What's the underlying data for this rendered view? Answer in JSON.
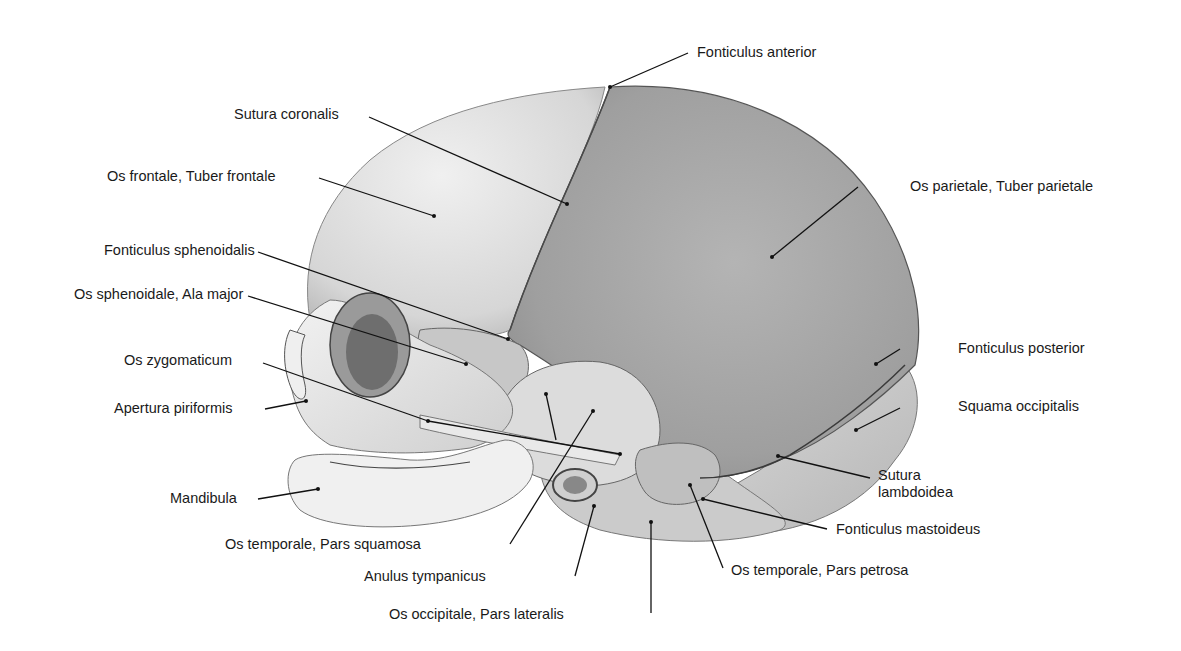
{
  "figure": {
    "colors": {
      "background": "#ffffff",
      "bone_light": "#e6e6e6",
      "bone_mid": "#cfcfcf",
      "parietal": "#a9a9a9",
      "suture_line": "#4a4a4a",
      "leader_line": "#111111",
      "label_text": "#1a1a1a"
    }
  },
  "labels": [
    {
      "id": "fonticulus-anterior",
      "text": "Fonticulus anterior",
      "x": 697,
      "y": 44,
      "anchor": "left",
      "line": [
        [
          688,
          53
        ],
        [
          610,
          87
        ]
      ]
    },
    {
      "id": "sutura-coronalis",
      "text": "Sutura coronalis",
      "x": 234,
      "y": 106,
      "anchor": "left",
      "line": [
        [
          369,
          117
        ],
        [
          567,
          204
        ]
      ]
    },
    {
      "id": "os-frontale",
      "text": "Os frontale, Tuber frontale",
      "x": 107,
      "y": 168,
      "anchor": "left",
      "line": [
        [
          319,
          178
        ],
        [
          434,
          216
        ]
      ]
    },
    {
      "id": "os-parietale",
      "text": "Os parietale, Tuber parietale",
      "x": 910,
      "y": 178,
      "anchor": "left",
      "line": [
        [
          858,
          187
        ],
        [
          772,
          257
        ]
      ]
    },
    {
      "id": "fonticulus-sphenoidalis",
      "text": "Fonticulus sphenoidalis",
      "x": 104,
      "y": 242,
      "anchor": "left",
      "line": [
        [
          258,
          252
        ],
        [
          508,
          339
        ]
      ]
    },
    {
      "id": "os-sphenoidale",
      "text": "Os sphenoidale, Ala major",
      "x": 74,
      "y": 286,
      "anchor": "left",
      "line": [
        [
          248,
          296
        ],
        [
          466,
          364
        ]
      ]
    },
    {
      "id": "fonticulus-posterior",
      "text": "Fonticulus posterior",
      "x": 958,
      "y": 340,
      "anchor": "left",
      "line": [
        [
          900,
          349
        ],
        [
          876,
          364
        ]
      ]
    },
    {
      "id": "os-zygomaticum",
      "text": "Os zygomaticum",
      "x": 124,
      "y": 352,
      "anchor": "left",
      "line": [
        [
          263,
          363
        ],
        [
          428,
          421
        ]
      ]
    },
    {
      "id": "apertura-piriformis",
      "text": "Apertura piriformis",
      "x": 114,
      "y": 400,
      "anchor": "left",
      "line": [
        [
          265,
          409
        ],
        [
          306,
          401
        ]
      ]
    },
    {
      "id": "squama-occipitalis",
      "text": "Squama occipitalis",
      "x": 958,
      "y": 398,
      "anchor": "left",
      "line": [
        [
          900,
          408
        ],
        [
          856,
          430
        ]
      ]
    },
    {
      "id": "sutura-lambdoidea",
      "text": "Sutura\nlambdoidea",
      "x": 878,
      "y": 467,
      "anchor": "left",
      "multiline": true,
      "line": [
        [
          870,
          478
        ],
        [
          778,
          456
        ]
      ]
    },
    {
      "id": "mandibula",
      "text": "Mandibula",
      "x": 170,
      "y": 490,
      "anchor": "left",
      "line": [
        [
          258,
          499
        ],
        [
          318,
          489
        ]
      ]
    },
    {
      "id": "fonticulus-mastoideus",
      "text": "Fonticulus mastoideus",
      "x": 836,
      "y": 521,
      "anchor": "left",
      "line": [
        [
          827,
          529
        ],
        [
          703,
          499
        ]
      ]
    },
    {
      "id": "os-temporale-pars-squamosa",
      "text": "Os temporale, Pars squamosa",
      "x": 225,
      "y": 536,
      "anchor": "left",
      "line": [
        [
          510,
          544
        ],
        [
          593,
          411
        ]
      ]
    },
    {
      "id": "anulus-tympanicus",
      "text": "Anulus tympanicus",
      "x": 364,
      "y": 568,
      "anchor": "left",
      "line": [
        [
          575,
          576
        ],
        [
          594,
          506
        ]
      ]
    },
    {
      "id": "os-temporale-pars-petrosa",
      "text": "Os temporale, Pars petrosa",
      "x": 731,
      "y": 562,
      "anchor": "left",
      "line": [
        [
          723,
          568
        ],
        [
          690,
          485
        ]
      ]
    },
    {
      "id": "os-occipitale-pars-lateralis",
      "text": "Os occipitale, Pars lateralis",
      "x": 389,
      "y": 606,
      "anchor": "left",
      "line": [
        [
          651,
          613
        ],
        [
          651,
          522
        ]
      ]
    }
  ],
  "extra_pointers": [
    {
      "for": "os-temporale-pars-squamosa",
      "line": [
        [
          556,
          440
        ],
        [
          546,
          394
        ]
      ]
    },
    {
      "for": "os-zygomaticum",
      "line": [
        [
          428,
          421
        ],
        [
          620,
          454
        ]
      ]
    }
  ]
}
